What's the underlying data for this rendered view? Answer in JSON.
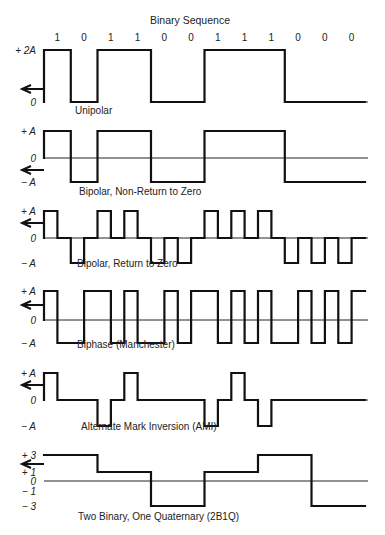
{
  "title": "Binary Sequence",
  "bits": [
    "1",
    "0",
    "1",
    "1",
    "0",
    "0",
    "1",
    "1",
    "1",
    "0",
    "0",
    "0"
  ],
  "colors": {
    "line": "#111111",
    "axis": "#222222",
    "text": "#222222",
    "background": "#ffffff"
  },
  "geometry": {
    "x0": 44,
    "bit_width": 26.75,
    "axis_end": 368
  },
  "panels": [
    {
      "name": "unipolar",
      "caption": "Unipolar",
      "caption_x": 75,
      "caption_y": 114,
      "scheme": "unipolar",
      "levels": [
        {
          "label": "+ 2A",
          "value": 2,
          "y": 50
        },
        {
          "label": "0",
          "value": 0,
          "y": 102
        }
      ],
      "zero_y": 102,
      "arrow_y": 89,
      "draw_zero_axis": false
    },
    {
      "name": "bipolar-nrz",
      "caption": "Bipolar, Non-Return to Zero",
      "caption_x": 79,
      "caption_y": 195,
      "scheme": "nrz",
      "levels": [
        {
          "label": "+ A",
          "value": 1,
          "y": 131
        },
        {
          "label": "0",
          "value": 0,
          "y": 158
        },
        {
          "label": "− A",
          "value": -1,
          "y": 182
        }
      ],
      "zero_y": 158,
      "arrow_y": 170,
      "draw_zero_axis": true
    },
    {
      "name": "bipolar-rz",
      "caption": "Bipolar, Return to Zero",
      "caption_x": 77,
      "caption_y": 267,
      "scheme": "rz",
      "levels": [
        {
          "label": "+ A",
          "value": 1,
          "y": 211
        },
        {
          "label": "0",
          "value": 0,
          "y": 238
        },
        {
          "label": "− A",
          "value": -1,
          "y": 263
        }
      ],
      "zero_y": 238,
      "arrow_y": 223,
      "draw_zero_axis": true
    },
    {
      "name": "manchester",
      "caption": "Biphase (Manchester)",
      "caption_x": 77,
      "caption_y": 348,
      "scheme": "manchester",
      "levels": [
        {
          "label": "+ A",
          "value": 1,
          "y": 291
        },
        {
          "label": "0",
          "value": 0,
          "y": 320
        },
        {
          "label": "− A",
          "value": -1,
          "y": 343
        }
      ],
      "zero_y": 320,
      "arrow_y": 305,
      "draw_zero_axis": true
    },
    {
      "name": "ami",
      "caption": "Alternate Mark Inversion (AMI)",
      "caption_x": 81,
      "caption_y": 430,
      "scheme": "ami",
      "levels": [
        {
          "label": "+ A",
          "value": 1,
          "y": 373
        },
        {
          "label": "0",
          "value": 0,
          "y": 400
        },
        {
          "label": "− A",
          "value": -1,
          "y": 426
        }
      ],
      "zero_y": 400,
      "arrow_y": 385,
      "draw_zero_axis": false
    },
    {
      "name": "2b1q",
      "caption": "Two Binary, One Quaternary (2B1Q)",
      "caption_x": 78,
      "caption_y": 520,
      "scheme": "2b1q",
      "levels": [
        {
          "label": "+ 3",
          "value": 3,
          "y": 455
        },
        {
          "label": "+ 1",
          "value": 1,
          "y": 472
        },
        {
          "label": "0",
          "value": 0,
          "y": 481
        },
        {
          "label": "− 1",
          "value": -1,
          "y": 491
        },
        {
          "label": "− 3",
          "value": -3,
          "y": 506
        }
      ],
      "zero_y": 481,
      "arrow_y": 464,
      "draw_zero_axis": true,
      "symbols": [
        3,
        1,
        -3,
        1,
        3,
        -3
      ]
    }
  ]
}
